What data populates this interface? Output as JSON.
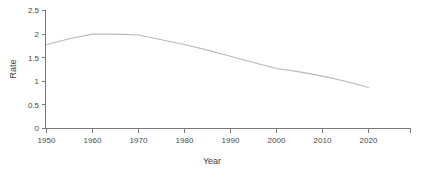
{
  "chart_data": {
    "type": "line",
    "title": "",
    "subtitle": "",
    "xlabel": "Year",
    "ylabel": "Rate",
    "xlim": [
      1945,
      2025
    ],
    "ylim": [
      0,
      2.5
    ],
    "grid": false,
    "legend": null,
    "legend_position": "none",
    "x_ticks": [
      1950,
      1960,
      1970,
      1980,
      1990,
      2000,
      2010,
      2020
    ],
    "x_tick_labels": [
      "1950",
      "1960",
      "1970",
      "1980",
      "1990",
      "2000",
      "2010",
      "2020"
    ],
    "y_ticks": [
      0,
      0.5,
      1,
      1.5,
      2,
      2.5
    ],
    "y_tick_labels": [
      "0",
      "0.5",
      "1",
      "1.5",
      "2",
      "2.5"
    ],
    "line_color": "#b9b9b9",
    "axis_color": "#7a7a7a",
    "background_color": "#ffffff",
    "x": [
      1950,
      1955,
      1960,
      1965,
      1970,
      1975,
      1980,
      1985,
      1990,
      1995,
      2000,
      2005,
      2010,
      2015,
      2020
    ],
    "values": [
      1.78,
      1.9,
      2.0,
      2.0,
      1.98,
      1.88,
      1.78,
      1.66,
      1.53,
      1.4,
      1.27,
      1.2,
      1.11,
      1.0,
      0.87
    ],
    "series": [
      {
        "name": "Rate",
        "values": [
          1.78,
          1.9,
          2.0,
          2.0,
          1.98,
          1.88,
          1.78,
          1.66,
          1.53,
          1.4,
          1.27,
          1.2,
          1.11,
          1.0,
          0.87
        ]
      }
    ],
    "annotations": []
  },
  "axis_titles": {
    "x": "Year",
    "y": "Rate"
  }
}
